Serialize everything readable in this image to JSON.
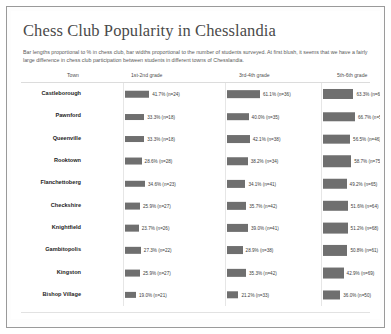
{
  "chart_data": {
    "type": "bar",
    "title": "Chess Club Popularity in Chesslandia",
    "subtitle": "Bar lengths proportional to % in chess club, bar widths proportional to the number of students surveyed. At first blush, it seems that we have a fairly large difference in chess club participation between students in different towns of Chesslandia.",
    "orientation": "horizontal",
    "grid": false,
    "legend": "none",
    "xlabel": "",
    "ylabel": "",
    "xlim": [
      0,
      100
    ],
    "columns": [
      "Town",
      "1st-2nd grade",
      "3rd-4th grade",
      "5th-6th grade"
    ],
    "categories": [
      "Castleborough",
      "Pawnford",
      "Queenville",
      "Rooktown",
      "Flanchettoberg",
      "Checkshire",
      "Knightfield",
      "Gambitopolis",
      "Kingston",
      "Bishop Village"
    ],
    "series": [
      {
        "name": "1st-2nd grade",
        "values": [
          41.7,
          33.3,
          33.3,
          28.6,
          34.6,
          25.9,
          23.7,
          27.3,
          25.9,
          19.0
        ],
        "n": [
          24,
          18,
          18,
          28,
          23,
          27,
          26,
          22,
          27,
          21
        ]
      },
      {
        "name": "3rd-4th grade",
        "values": [
          61.1,
          40.0,
          42.1,
          38.2,
          34.1,
          35.7,
          39.0,
          28.9,
          35.3,
          21.2
        ],
        "n": [
          36,
          35,
          38,
          34,
          41,
          42,
          41,
          38,
          42,
          33
        ]
      },
      {
        "name": "5th-6th grade",
        "values": [
          63.3,
          66.7,
          56.5,
          58.7,
          49.2,
          51.6,
          51.2,
          50.8,
          42.9,
          36.0
        ],
        "n": [
          60,
          54,
          46,
          75,
          65,
          64,
          68,
          61,
          69,
          50
        ]
      }
    ],
    "colors": {
      "bar": "#6f6f6f",
      "title": "#4a4a4a",
      "text": "#3c3c3c",
      "frame": "#9a9a9a",
      "rule": "#dcdcdc"
    }
  },
  "header": {
    "town": "Town",
    "g12": "1st-2nd grade",
    "g34": "3rd-4th grade",
    "g56": "5th-6th grade"
  },
  "title": "Chess Club Popularity in Chesslandia",
  "subtitle": "Bar lengths proportional to % in chess club, bar widths proportional to the number of students surveyed. At first blush, it seems that we have a fairly large difference in chess club participation between students in different towns of Chesslandia."
}
